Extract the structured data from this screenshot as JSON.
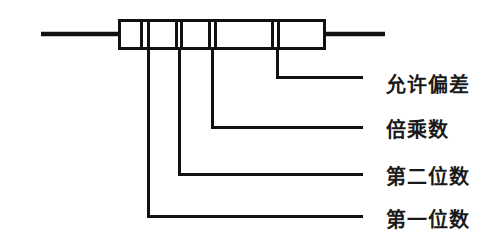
{
  "diagram": {
    "colors": {
      "stroke": "#111111",
      "background": "#ffffff",
      "text": "#1a1a1a"
    },
    "component": {
      "name": "resistor-body",
      "body": {
        "x": 118,
        "y": 19,
        "width": 207,
        "height": 30,
        "stroke_width": 3
      },
      "leads": [
        {
          "name": "left-lead",
          "x1": 41,
          "y1": 34,
          "x2": 120,
          "y2": 34,
          "stroke_width": 4
        },
        {
          "name": "right-lead",
          "x1": 323,
          "y1": 34,
          "x2": 385,
          "y2": 34,
          "stroke_width": 4
        }
      ],
      "bands": [
        {
          "name": "band-1-first-digit",
          "x": 140,
          "width": 3
        },
        {
          "name": "band-1b",
          "x": 147,
          "width": 3
        },
        {
          "name": "band-2-second-digit",
          "x": 176,
          "width": 3
        },
        {
          "name": "band-2b",
          "x": 181,
          "width": 3
        },
        {
          "name": "band-3-multiplier",
          "x": 209,
          "width": 3
        },
        {
          "name": "band-3b",
          "x": 214,
          "width": 3
        },
        {
          "name": "band-4-tolerance",
          "x": 272,
          "width": 3
        },
        {
          "name": "band-4b",
          "x": 277,
          "width": 3
        }
      ]
    },
    "callouts": [
      {
        "id": "tolerance",
        "label": "允许偏差",
        "band_index": 4,
        "leader": {
          "x": 277,
          "y_top": 49,
          "y_turn": 77,
          "x_end": 363
        },
        "label_x": 386,
        "label_y": 85
      },
      {
        "id": "multiplier",
        "label": "倍乘数",
        "band_index": 3,
        "leader": {
          "x": 212,
          "y_top": 49,
          "y_turn": 127,
          "x_end": 363
        },
        "label_x": 386,
        "label_y": 130
      },
      {
        "id": "second-digit",
        "label": "第二位数",
        "band_index": 2,
        "leader": {
          "x": 179,
          "y_top": 49,
          "y_turn": 174,
          "x_end": 363
        },
        "label_x": 386,
        "label_y": 177
      },
      {
        "id": "first-digit",
        "label": "第一位数",
        "band_index": 1,
        "leader": {
          "x": 148,
          "y_top": 49,
          "y_turn": 216,
          "x_end": 363
        },
        "label_x": 386,
        "label_y": 220
      }
    ]
  }
}
